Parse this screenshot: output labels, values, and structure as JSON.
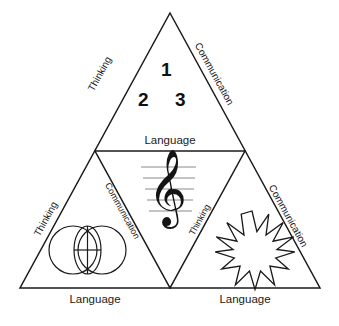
{
  "diagram": {
    "stroke_color": "#1a1a1a",
    "background_color": "#ffffff",
    "staff_color": "#8a8a8a",
    "labels": {
      "thinking": "Thinking",
      "communication": "Communication",
      "language": "Language"
    },
    "top_triangle": {
      "name": "top-triangle",
      "left_edge_label": "Thinking",
      "right_edge_label": "Communication",
      "bottom_edge_label": "Language",
      "numerals": [
        "1",
        "2",
        "3"
      ]
    },
    "bottom_left_triangle": {
      "name": "bottom-left-triangle",
      "left_edge_label": "Thinking",
      "right_edge_label": "Communication",
      "bottom_edge_label": "Language",
      "symbol": "venn-circles-icon"
    },
    "center_triangle": {
      "name": "center-inverted-triangle",
      "symbol": "treble-clef-icon",
      "glyph": "𝄞",
      "staff_lines": 5
    },
    "bottom_right_triangle": {
      "name": "bottom-right-triangle",
      "left_edge_label": "Thinking",
      "right_edge_label": "Communication",
      "bottom_edge_label": "Language",
      "symbol": "starburst-icon",
      "star_points": 12
    }
  }
}
